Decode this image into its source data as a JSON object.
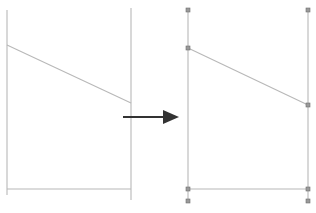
{
  "figure": {
    "title": "",
    "background_color": "#ffffff",
    "width": 316,
    "height": 213,
    "description": "Before-and-after geometry diagram: a wireframe outline on the left transforms, via a rightward arrow, into the same outline with vertex handles shown on the right."
  },
  "style": {
    "line_color": "#b8b8b8",
    "line_color_dark": "#a0a0a0",
    "line_width": 1.1,
    "vertex_fill": "#9a9a9a",
    "vertex_stroke": "#6e6e6e",
    "vertex_size": 4,
    "arrow_color": "#333333",
    "arrow_shaft_width": 2.2
  },
  "panels": [
    {
      "id": "left-panel",
      "name": "source-shape",
      "label": "",
      "has_vertex_handles": false,
      "segments": [
        {
          "name": "left-vertical-edge",
          "x1": 7,
          "y1": 10,
          "x2": 7,
          "y2": 195
        },
        {
          "name": "right-vertical-edge",
          "x1": 131,
          "y1": 8,
          "x2": 131,
          "y2": 200
        },
        {
          "name": "upper-diagonal-edge",
          "x1": 7,
          "y1": 45,
          "x2": 131,
          "y2": 103
        },
        {
          "name": "bottom-horizontal-edge",
          "x1": 7,
          "y1": 189,
          "x2": 131,
          "y2": 189
        }
      ],
      "vertices": []
    },
    {
      "id": "right-panel",
      "name": "result-shape",
      "label": "",
      "has_vertex_handles": true,
      "segments": [
        {
          "name": "left-vertical-edge",
          "x1": 188,
          "y1": 10,
          "x2": 188,
          "y2": 201
        },
        {
          "name": "right-vertical-edge",
          "x1": 308,
          "y1": 10,
          "x2": 308,
          "y2": 201
        },
        {
          "name": "upper-diagonal-edge",
          "x1": 188,
          "y1": 48,
          "x2": 308,
          "y2": 105
        },
        {
          "name": "bottom-horizontal-edge",
          "x1": 188,
          "y1": 189,
          "x2": 308,
          "y2": 189
        }
      ],
      "vertices": [
        {
          "name": "vertex-top-left",
          "x": 188,
          "y": 10
        },
        {
          "name": "vertex-diagonal-start",
          "x": 188,
          "y": 48
        },
        {
          "name": "vertex-bottom-left",
          "x": 188,
          "y": 189
        },
        {
          "name": "vertex-base-left",
          "x": 188,
          "y": 201
        },
        {
          "name": "vertex-top-right",
          "x": 308,
          "y": 10
        },
        {
          "name": "vertex-diagonal-end",
          "x": 308,
          "y": 105
        },
        {
          "name": "vertex-bottom-right",
          "x": 308,
          "y": 189
        },
        {
          "name": "vertex-base-right",
          "x": 308,
          "y": 201
        }
      ]
    }
  ],
  "arrow": {
    "name": "transformation-arrow",
    "label": "",
    "shaft": {
      "x1": 123,
      "y1": 117,
      "x2": 168,
      "y2": 117
    },
    "head": {
      "tip_x": 179,
      "tip_y": 117,
      "back_x": 163,
      "half_height": 7
    },
    "direction": "right"
  }
}
